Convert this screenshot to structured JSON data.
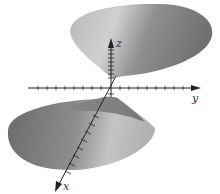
{
  "figure": {
    "type": "3d-surface",
    "axes": {
      "x_label": "x",
      "y_label": "y",
      "z_label": "z"
    },
    "colors": {
      "surface_light": "#c8c8c8",
      "surface_mid": "#9a9a9a",
      "surface_dark": "#6e6e6e",
      "axis": "#222222",
      "background": "#ffffff"
    }
  }
}
